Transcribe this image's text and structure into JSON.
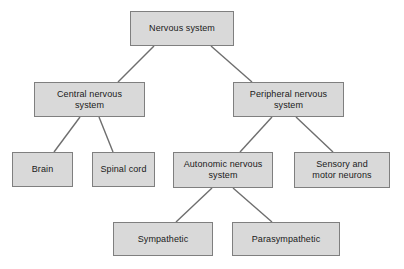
{
  "diagram": {
    "type": "tree",
    "canvas": {
      "width": 404,
      "height": 269,
      "background": "#ffffff"
    },
    "style": {
      "node_fill": "#d9d9d9",
      "node_border": "#7f7f7f",
      "edge_color": "#6e6e6e",
      "text_color": "#1a1a1a"
    },
    "nodes": [
      {
        "id": "nervous-system",
        "label": "Nervous system",
        "x": 130,
        "y": 11,
        "w": 104,
        "h": 35,
        "level": 0
      },
      {
        "id": "central-nervous-system",
        "label": "Central nervous\nsystem",
        "x": 34,
        "y": 82,
        "w": 111,
        "h": 35,
        "level": 1
      },
      {
        "id": "peripheral-nervous-system",
        "label": "Peripheral nervous\nsystem",
        "x": 233,
        "y": 82,
        "w": 111,
        "h": 35,
        "level": 1
      },
      {
        "id": "brain",
        "label": "Brain",
        "x": 12,
        "y": 152,
        "w": 61,
        "h": 35,
        "level": 2
      },
      {
        "id": "spinal-cord",
        "label": "Spinal cord",
        "x": 92,
        "y": 152,
        "w": 63,
        "h": 35,
        "level": 2
      },
      {
        "id": "autonomic-nervous-system",
        "label": "Autonomic nervous\nsystem",
        "x": 173,
        "y": 152,
        "w": 100,
        "h": 36,
        "level": 2
      },
      {
        "id": "sensory-and-motor-neurons",
        "label": "Sensory and\nmotor neurons",
        "x": 294,
        "y": 152,
        "w": 96,
        "h": 36,
        "level": 2
      },
      {
        "id": "sympathetic",
        "label": "Sympathetic",
        "x": 113,
        "y": 222,
        "w": 100,
        "h": 34,
        "level": 3
      },
      {
        "id": "parasympathetic",
        "label": "Parasympathetic",
        "x": 232,
        "y": 222,
        "w": 108,
        "h": 34,
        "level": 3
      }
    ],
    "edges": [
      {
        "id": "edge-nervous-to-central",
        "from": "nervous-system",
        "to": "central-nervous-system",
        "x1": 154,
        "y1": 46,
        "x2": 118,
        "y2": 82
      },
      {
        "id": "edge-nervous-to-peripheral",
        "from": "nervous-system",
        "to": "peripheral-nervous-system",
        "x1": 211,
        "y1": 46,
        "x2": 252,
        "y2": 82
      },
      {
        "id": "edge-central-to-brain",
        "from": "central-nervous-system",
        "to": "brain",
        "x1": 80,
        "y1": 117,
        "x2": 54,
        "y2": 152
      },
      {
        "id": "edge-central-to-spinal",
        "from": "central-nervous-system",
        "to": "spinal-cord",
        "x1": 99,
        "y1": 117,
        "x2": 113,
        "y2": 152
      },
      {
        "id": "edge-peripheral-to-autonomic",
        "from": "peripheral-nervous-system",
        "to": "autonomic-nervous-system",
        "x1": 272,
        "y1": 117,
        "x2": 240,
        "y2": 152
      },
      {
        "id": "edge-peripheral-to-sensory",
        "from": "peripheral-nervous-system",
        "to": "sensory-and-motor-neurons",
        "x1": 296,
        "y1": 117,
        "x2": 333,
        "y2": 152
      },
      {
        "id": "edge-autonomic-to-sympathetic",
        "from": "autonomic-nervous-system",
        "to": "sympathetic",
        "x1": 212,
        "y1": 188,
        "x2": 176,
        "y2": 222
      },
      {
        "id": "edge-autonomic-to-parasympathetic",
        "from": "autonomic-nervous-system",
        "to": "parasympathetic",
        "x1": 233,
        "y1": 188,
        "x2": 272,
        "y2": 222
      }
    ]
  }
}
